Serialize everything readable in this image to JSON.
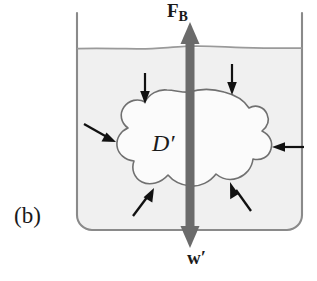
{
  "figure": {
    "panel_label": "(b)",
    "caption_subject": "buoyant force and weight on a submerged fluid element",
    "body_label": "D′",
    "buoyant_force_symbol": "F",
    "buoyant_force_subscript": "B",
    "weight_symbol": "w′"
  },
  "colors": {
    "background": "#ffffff",
    "water_fill": "#f2f2f2",
    "body_fill": "#fbfbfb",
    "vessel_stroke": "#8a8a8a",
    "water_surface_stroke": "#9a9a9a",
    "body_outline_stroke": "#707070",
    "main_arrow_fill": "#6b6b6b",
    "pressure_arrow_fill": "#111111",
    "text": "#1a1a1a"
  },
  "vessel": {
    "left_wall_x": 77,
    "right_wall_x": 302,
    "top_y": 13,
    "bottom_y": 230,
    "corner_radius": 15,
    "water_surface_y": 48
  },
  "main_arrow": {
    "name": "buoyancy-weight-double-arrow",
    "x": 190,
    "top_y": 24,
    "bottom_y": 246,
    "shaft_width": 9,
    "head_width": 19,
    "head_length": 22,
    "direction": "double-headed-vertical"
  },
  "pressure_arrows": [
    {
      "id": 1,
      "label": "pressure-arrow-top-left",
      "direction": "down",
      "tail_x": 145,
      "tail_y": 73,
      "tip_x": 145,
      "tip_y": 103
    },
    {
      "id": 2,
      "label": "pressure-arrow-top-right",
      "direction": "down",
      "tail_x": 232,
      "tail_y": 64,
      "tip_x": 232,
      "tip_y": 94
    },
    {
      "id": 3,
      "label": "pressure-arrow-left",
      "direction": "down-right",
      "tail_x": 84,
      "tail_y": 124,
      "tip_x": 114,
      "tip_y": 141
    },
    {
      "id": 4,
      "label": "pressure-arrow-right",
      "direction": "left",
      "tail_x": 303,
      "tail_y": 147,
      "tip_x": 271,
      "tip_y": 147
    },
    {
      "id": 5,
      "label": "pressure-arrow-bottom-left",
      "direction": "up-right",
      "tail_x": 133,
      "tail_y": 216,
      "tip_x": 153,
      "tip_y": 190
    },
    {
      "id": 6,
      "label": "pressure-arrow-bottom-right",
      "direction": "up-left",
      "tail_x": 251,
      "tail_y": 211,
      "tip_x": 231,
      "tip_y": 183
    }
  ],
  "body_outline": {
    "name": "submerged-body-outline",
    "center_x": 190,
    "center_y": 145,
    "approx_width": 176,
    "approx_height": 112,
    "shape": "irregular closed blob"
  }
}
